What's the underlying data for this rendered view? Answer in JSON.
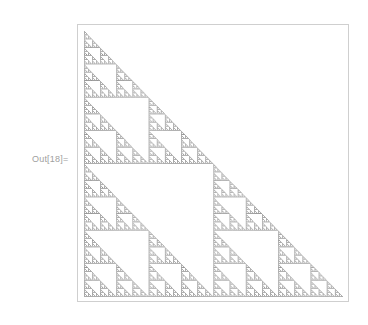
{
  "cell": {
    "output_label": "Out[18]="
  },
  "graphic": {
    "type": "sierpinski-triangle",
    "orientation": "right-angle-bottom-left",
    "levels": 6,
    "fill_color": "#5a5a5a",
    "frame_color": "#cfcfcf"
  }
}
